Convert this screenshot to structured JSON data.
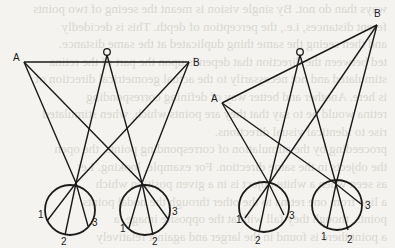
{
  "background_bleed_text": [
    "ways than do not. By single vision is meant the seeing of two points",
    "ferent distances, i.e., the perception of depth. This is decidedly",
    "and then seeing the same thing duplicated at the same distance.",
    "ted between the direction that depends upon the part of the retina",
    "stimulated and not necessarily to the actual geometrical direction of",
    "is here. Another and better way of defining corresponding",
    "retina would be to say that they are points which, when stimulated",
    "rise to identical visual directions.",
    "",
    "proceeding by the stimulation of corresponding points, the open",
    "the objects in the same direction. For example, looking. Let",
    "as seen when a white object is in a given position which",
    "a line from one retina to the other through the nodal points",
    "points, though they fall with at the opposite image, a",
    "a point there is found in the larger and against relatively"
  ],
  "figures": [
    {
      "id": "left",
      "labels": {
        "A": "A",
        "B": "B",
        "O": "O"
      },
      "points": {
        "A": [
          24,
          62
        ],
        "B": [
          189,
          62
        ],
        "O": [
          107,
          55
        ]
      },
      "fixation_line": [
        "A",
        "B"
      ],
      "eyes": [
        {
          "id": "left-eye",
          "center": [
            70,
            210
          ],
          "r": 25,
          "nodal": [
            76,
            183
          ],
          "retina": {
            "1": [
              47,
              221
            ],
            "2": [
              65,
              235
            ],
            "3": [
              88,
              226
            ]
          },
          "labels": {
            "1": "1",
            "2": "2",
            "3": "3"
          },
          "label_pos": {
            "1": [
              38,
              218
            ],
            "2": [
              61,
              245
            ],
            "3": [
              92,
              226
            ]
          }
        },
        {
          "id": "right-eye",
          "center": [
            145,
            210
          ],
          "r": 25,
          "nodal": [
            142,
            183
          ],
          "retina": {
            "1": [
              129,
              228
            ],
            "2": [
              153,
              235
            ],
            "3": [
              168,
              219
            ]
          },
          "labels": {
            "1": "1",
            "2": "2",
            "3": "3"
          },
          "label_pos": {
            "1": [
              120,
              232
            ],
            "2": [
              152,
              245
            ],
            "3": [
              172,
              215
            ]
          }
        }
      ]
    },
    {
      "id": "right",
      "labels": {
        "A": "A",
        "B": "B",
        "O": "O"
      },
      "points": {
        "A": [
          222,
          103
        ],
        "B": [
          377,
          25
        ],
        "O": [
          300,
          55
        ]
      },
      "fixation_line": [
        "A",
        "B"
      ],
      "eyes": [
        {
          "id": "left-eye",
          "center": [
            264,
            207
          ],
          "r": 25,
          "nodal": [
            269,
            184
          ],
          "retina": {
            "1": [
              245,
              218
            ],
            "2": [
              259,
              232
            ],
            "3": [
              284,
              215
            ]
          },
          "labels": {
            "1": "1",
            "2": "2",
            "3": "3"
          },
          "label_pos": {
            "1": [
              236,
              223
            ],
            "2": [
              255,
              244
            ],
            "3": [
              289,
              219
            ]
          }
        },
        {
          "id": "right-eye",
          "center": [
            337,
            205
          ],
          "r": 25,
          "nodal": [
            336,
            184
          ],
          "retina": {
            "1": [
              327,
              228
            ],
            "2": [
              348,
              230
            ],
            "3": [
              361,
              204
            ]
          },
          "labels": {
            "1": "1",
            "2": "2",
            "3": "3"
          },
          "label_pos": {
            "1": [
              321,
              240
            ],
            "2": [
              347,
              243
            ],
            "3": [
              365,
              209
            ]
          }
        }
      ]
    }
  ]
}
